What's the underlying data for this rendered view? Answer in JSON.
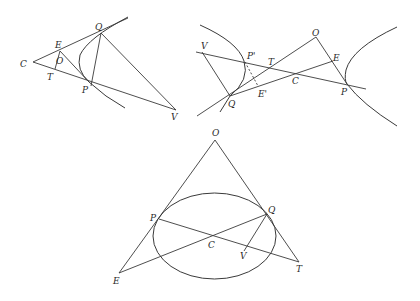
{
  "figures": [
    {
      "id": "hyperbola-branch-tangents",
      "labels": {
        "C": "C",
        "E": "E",
        "O": "O",
        "T": "T",
        "Q": "Q",
        "P": "P",
        "V": "V"
      }
    },
    {
      "id": "hyperbola-two-branches",
      "labels": {
        "V": "V",
        "P_prime": "P'",
        "T": "T",
        "O": "O",
        "E": "E",
        "C": "C",
        "Q": "Q",
        "E_prime": "E'",
        "P": "P"
      }
    },
    {
      "id": "ellipse-tangents",
      "labels": {
        "O": "O",
        "P": "P",
        "Q": "Q",
        "C": "C",
        "V": "V",
        "E": "E",
        "T": "T"
      }
    }
  ],
  "colors": {
    "stroke": "#3a3a3a",
    "text": "#2a2a2a",
    "background": "#ffffff"
  }
}
